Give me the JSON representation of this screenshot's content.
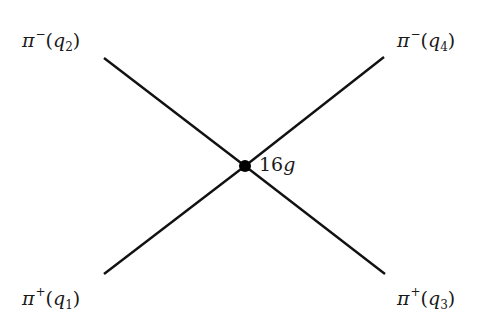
{
  "diagram": {
    "type": "feynman-vertex",
    "colors": {
      "line": "#111111",
      "vertex": "#000000",
      "text": "#1a1a1a",
      "background": "#ffffff"
    },
    "vertex": {
      "x": 245,
      "y": 166,
      "radius": 6,
      "coupling": {
        "coefficient": "16",
        "symbol": "g",
        "full": "16g"
      }
    },
    "legs": [
      {
        "id": "q2",
        "particle": "π",
        "charge": "−",
        "momentum": "q",
        "index": "2",
        "position": "top-left",
        "line": {
          "x1": 104,
          "y1": 58,
          "x2": 245,
          "y2": 166
        }
      },
      {
        "id": "q4",
        "particle": "π",
        "charge": "−",
        "momentum": "q",
        "index": "4",
        "position": "top-right",
        "line": {
          "x1": 384,
          "y1": 57,
          "x2": 245,
          "y2": 166
        }
      },
      {
        "id": "q1",
        "particle": "π",
        "charge": "+",
        "momentum": "q",
        "index": "1",
        "position": "bottom-left",
        "line": {
          "x1": 104,
          "y1": 274,
          "x2": 245,
          "y2": 166
        }
      },
      {
        "id": "q3",
        "particle": "π",
        "charge": "+",
        "momentum": "q",
        "index": "3",
        "position": "bottom-right",
        "line": {
          "x1": 385,
          "y1": 274,
          "x2": 245,
          "y2": 166
        }
      }
    ],
    "labels": {
      "top_left": {
        "particle": "π",
        "charge": "−",
        "open": "(",
        "momentum": "q",
        "index": "2",
        "close": ")",
        "full": "π−(q2)"
      },
      "top_right": {
        "particle": "π",
        "charge": "−",
        "open": "(",
        "momentum": "q",
        "index": "4",
        "close": ")",
        "full": "π−(q4)"
      },
      "bottom_left": {
        "particle": "π",
        "charge": "+",
        "open": "(",
        "momentum": "q",
        "index": "1",
        "close": ")",
        "full": "π+(q1)"
      },
      "bottom_right": {
        "particle": "π",
        "charge": "+",
        "open": "(",
        "momentum": "q",
        "index": "3",
        "close": ")",
        "full": "π+(q3)"
      }
    }
  }
}
